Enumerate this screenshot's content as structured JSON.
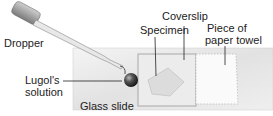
{
  "labels": {
    "dropper": "Dropper",
    "specimen": "Specimen",
    "coverslip": "Coverslip",
    "paper_towel_line1": "Piece of",
    "paper_towel_line2": "paper towel",
    "lugols_line1": "Lugol's",
    "lugols_line2": "solution",
    "glass_slide": "Glass slide"
  }
}
